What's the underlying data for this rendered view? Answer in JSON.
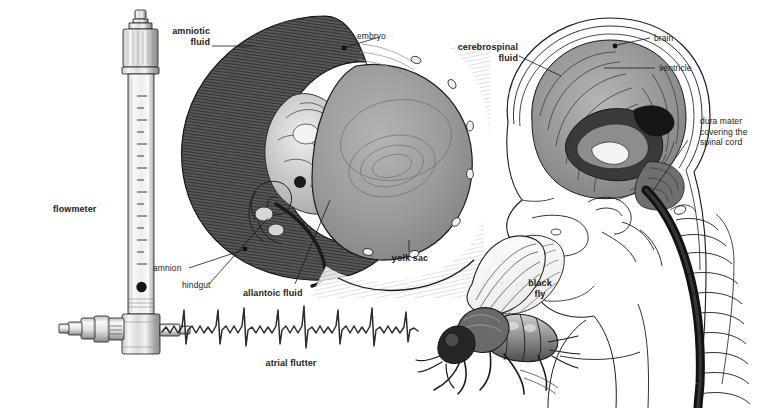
{
  "page": {
    "width": 759,
    "height": 408,
    "background": "#ffffff",
    "ink": "#1b1b1b"
  },
  "figures": [
    {
      "id": "flowmeter",
      "name": "flowmeter-illustration",
      "label": "flowmeter",
      "label_bold": true,
      "description": "Vertical glass tube flowmeter with calibrated scale, float ball, top knurled cap and horizontal inlet fitting at base"
    },
    {
      "id": "embryo",
      "name": "embryo-illustration",
      "description": "Sectional drawing of an embryo inside amniotic sac with attached yolk sac",
      "labels": [
        "amniotic fluid",
        "embryo",
        "yolk sac",
        "amnion",
        "hindgut",
        "allantoic fluid"
      ]
    },
    {
      "id": "head",
      "name": "head-sagittal-illustration",
      "description": "Mid-sagittal section of human head and neck showing brain, ventricles, cerebrospinal fluid and dura mater over the spinal cord",
      "labels": [
        "cerebrospinal fluid",
        "brain",
        "ventricle",
        "dura mater covering the spinal cord"
      ]
    },
    {
      "id": "ecg",
      "name": "ecg-trace-illustration",
      "label": "atrial flutter",
      "description": "Electrocardiogram rhythm strip showing atrial flutter with sawtooth flutter waves"
    },
    {
      "id": "fly",
      "name": "black-fly-illustration",
      "label": "black fly",
      "description": "Lateral view drawing of a black fly (Simulium) with wings folded"
    }
  ],
  "labels": {
    "flowmeter": "flowmeter",
    "amniotic_fluid": "amniotic\nfluid",
    "embryo": "embryo",
    "yolk_sac": "yolk sac",
    "amnion": "amnion",
    "hindgut": "hindgut",
    "allantoic_fluid": "allantoic fluid",
    "cerebrospinal_fluid": "cerebrospinal\nfluid",
    "brain": "brain",
    "ventricle": "ventricle",
    "dura_mater": "dura mater\ncovering the\nspinal cord",
    "black_fly": "black\nfly",
    "atrial_flutter": "atrial flutter"
  },
  "colors": {
    "ink": "#1b1b1b",
    "dark_shell": "#4a4a4a",
    "mid_gray": "#9a9a9a",
    "light_gray": "#c9c9c9",
    "pale_gray": "#e4e4e4",
    "yolk_gray": "#9d9d9d",
    "brain_gray": "#8e8e8e",
    "background": "#ffffff"
  }
}
